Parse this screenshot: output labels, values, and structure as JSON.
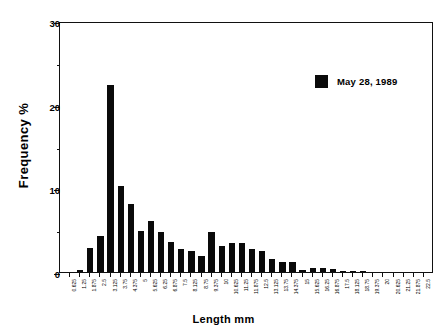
{
  "chart": {
    "type": "bar",
    "title": "",
    "xlabel": "Length  mm",
    "ylabel_text": "Frequency",
    "ylabel_unit": "%",
    "legend": {
      "position": "top-right",
      "entries": [
        {
          "label": "May 28, 1989",
          "color": "#0a0a0a",
          "marker": "filled-square"
        }
      ]
    }
  },
  "chart_data": {
    "type": "bar",
    "title": "",
    "xlabel": "Length  mm",
    "ylabel": "Frequency  %",
    "ylim": [
      0,
      30
    ],
    "yticks": [
      0,
      10,
      20,
      30
    ],
    "yticks_minor": [
      5,
      15,
      25
    ],
    "grid": false,
    "legend_position": "top-right",
    "categories": [
      "0.625",
      "1.25",
      "1.875",
      "2.5",
      "3.125",
      "3.75",
      "4.375",
      "5",
      "5.625",
      "6.25",
      "6.875",
      "7.5",
      "8.125",
      "8.75",
      "9.375",
      "10",
      "10.625",
      "11.25",
      "11.875",
      "12.5",
      "13.125",
      "13.75",
      "14.375",
      "15",
      "15.625",
      "16.25",
      "16.875",
      "17.5",
      "18.125",
      "18.75",
      "19.375",
      "20",
      "20.625",
      "21.25",
      "21.875",
      "22.5"
    ],
    "series": [
      {
        "name": "May 28, 1989",
        "color": "#0a0a0a",
        "values": [
          0.0,
          0.2,
          2.9,
          4.3,
          22.4,
          10.3,
          8.1,
          4.9,
          6.1,
          4.8,
          3.6,
          2.8,
          2.5,
          1.9,
          4.8,
          3.1,
          3.5,
          3.5,
          2.8,
          2.5,
          1.5,
          1.2,
          1.2,
          0.3,
          0.5,
          0.5,
          0.4,
          0.15,
          0.15,
          0.05,
          0.0,
          0.0,
          0.0,
          0.0,
          0.0,
          0.0
        ]
      }
    ]
  }
}
